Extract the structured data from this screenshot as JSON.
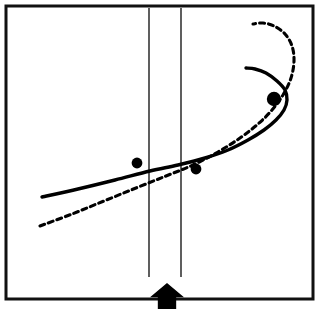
{
  "figure": {
    "title": "",
    "caption": "",
    "width": 327,
    "height": 313,
    "background_color": "#ffffff",
    "ink_color": "#000000"
  },
  "frame": {
    "name": "outer-border",
    "x": 6,
    "y": 6,
    "width": 307,
    "height": 293,
    "stroke_width": 3,
    "stroke_color": "#111111",
    "fill": "#ffffff"
  },
  "chart_data": {
    "type": "line",
    "title": "",
    "subtitle": "",
    "xlabel": "",
    "ylabel": "",
    "xlim": [
      6,
      313
    ],
    "ylim": [
      299,
      6
    ],
    "grid": false,
    "legend": "none",
    "axis_ticks": [],
    "tick_labels": [],
    "annotations": [
      {
        "name": "up-arrow-marker",
        "kind": "arrow",
        "direction": "up",
        "x": 167,
        "y": 283,
        "width": 34,
        "height": 26,
        "color": "#000000",
        "label": ""
      }
    ],
    "series": [
      {
        "name": "solid-fold-curve",
        "style": "solid",
        "stroke_width": 3.4,
        "color": "#000000",
        "points": [
          [
            42,
            197
          ],
          [
            78,
            189
          ],
          [
            115,
            180
          ],
          [
            150,
            171
          ],
          [
            178,
            165
          ],
          [
            205,
            158
          ],
          [
            228,
            150
          ],
          [
            248,
            140
          ],
          [
            264,
            130
          ],
          [
            276,
            120
          ],
          [
            284,
            110
          ],
          [
            287,
            100
          ],
          [
            285,
            90
          ],
          [
            277,
            81
          ],
          [
            266,
            73
          ],
          [
            255,
            69
          ],
          [
            246,
            68
          ]
        ]
      },
      {
        "name": "dashed-curve",
        "style": "dashed",
        "stroke_width": 3.1,
        "dash_pattern": [
          5,
          4
        ],
        "color": "#000000",
        "points": [
          [
            40,
            226
          ],
          [
            72,
            214
          ],
          [
            104,
            201
          ],
          [
            136,
            188
          ],
          [
            166,
            176
          ],
          [
            193,
            165
          ],
          [
            218,
            152
          ],
          [
            240,
            138
          ],
          [
            258,
            124
          ],
          [
            272,
            110
          ],
          [
            283,
            95
          ],
          [
            291,
            78
          ],
          [
            294,
            61
          ],
          [
            292,
            46
          ],
          [
            285,
            34
          ],
          [
            274,
            26
          ],
          [
            263,
            23
          ],
          [
            253,
            24
          ]
        ]
      }
    ],
    "markers": [
      {
        "name": "data-point-left",
        "x": 137,
        "y": 163,
        "r": 5.4,
        "color": "#000000",
        "label": ""
      },
      {
        "name": "data-point-mid",
        "x": 196,
        "y": 169,
        "r": 5.4,
        "color": "#000000",
        "label": ""
      },
      {
        "name": "data-point-upper",
        "x": 274,
        "y": 99,
        "r": 7.2,
        "color": "#000000",
        "label": ""
      }
    ],
    "reference_lines": [
      {
        "name": "reference-line-left",
        "orientation": "vertical",
        "x": 149,
        "y1": 8,
        "y2": 277,
        "stroke_width": 1.4,
        "color": "#1a1a1a"
      },
      {
        "name": "reference-line-right",
        "orientation": "vertical",
        "x": 181,
        "y1": 8,
        "y2": 277,
        "stroke_width": 1.4,
        "color": "#1a1a1a"
      }
    ]
  }
}
